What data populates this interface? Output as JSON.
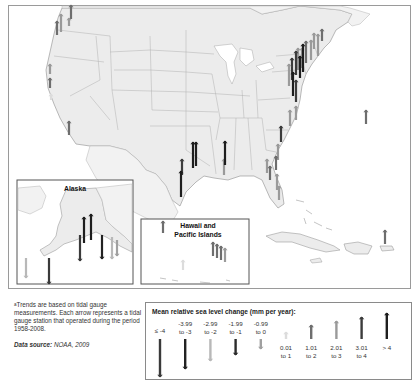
{
  "map": {
    "insets": {
      "alaska": {
        "title": "Alaska"
      },
      "hawaii": {
        "title": "Hawaii and Pacific Islands"
      }
    },
    "colors": {
      "land": "#ececec",
      "state_border": "#a8a8a8",
      "water": "#ffffff",
      "frame": "#9a9a9a"
    },
    "class_colors": {
      "le_-4": "#3a3a3a",
      "-3.99_-3": "#222222",
      "-2.99_-2": "#b8b8b8",
      "-1.99_-1": "#2c2c2c",
      "-0.99_0": "#a0a0a0",
      "0.01_1": "#dcdcdc",
      "1.01_2": "#6e6e6e",
      "2.01_3": "#9a9a9a",
      "3.01_4": "#3c3c3c",
      "gt_4": "#1e1e1e"
    },
    "stations": [
      {
        "region": "pacific_nw",
        "x": 71,
        "y": 19,
        "len": 14,
        "dir": "up",
        "cls": "1.01_2"
      },
      {
        "region": "pacific_nw",
        "x": 69,
        "y": 26,
        "len": 8,
        "dir": "up",
        "cls": "2.01_3"
      },
      {
        "region": "pacific_nw",
        "x": 57,
        "y": 35,
        "len": 14,
        "dir": "up",
        "cls": "1.01_2"
      },
      {
        "region": "pacific_nw",
        "x": 61,
        "y": 32,
        "len": 18,
        "dir": "up",
        "cls": "2.01_3"
      },
      {
        "region": "california",
        "x": 50,
        "y": 74,
        "len": 10,
        "dir": "up",
        "cls": "2.01_3"
      },
      {
        "region": "california",
        "x": 50,
        "y": 88,
        "len": 10,
        "dir": "up",
        "cls": "1.01_2"
      },
      {
        "region": "california",
        "x": 51,
        "y": 100,
        "len": 6,
        "dir": "up",
        "cls": "0.01_1"
      },
      {
        "region": "california",
        "x": 69,
        "y": 135,
        "len": 14,
        "dir": "up",
        "cls": "1.01_2"
      },
      {
        "region": "northeast",
        "x": 322,
        "y": 41,
        "len": 12,
        "dir": "up",
        "cls": "1.01_2"
      },
      {
        "region": "northeast",
        "x": 314,
        "y": 49,
        "len": 16,
        "dir": "up",
        "cls": "2.01_3"
      },
      {
        "region": "northeast",
        "x": 318,
        "y": 56,
        "len": 22,
        "dir": "up",
        "cls": "2.01_3"
      },
      {
        "region": "northeast",
        "x": 311,
        "y": 60,
        "len": 20,
        "dir": "up",
        "cls": "2.01_3"
      },
      {
        "region": "northeast",
        "x": 306,
        "y": 63,
        "len": 22,
        "dir": "up",
        "cls": "1.01_2"
      },
      {
        "region": "northeast",
        "x": 302,
        "y": 68,
        "len": 20,
        "dir": "up",
        "cls": "2.01_3"
      },
      {
        "region": "northeast",
        "x": 298,
        "y": 70,
        "len": 22,
        "dir": "up",
        "cls": "2.01_3"
      },
      {
        "region": "northeast",
        "x": 303,
        "y": 72,
        "len": 28,
        "dir": "up",
        "cls": "gt_4"
      },
      {
        "region": "northeast",
        "x": 296,
        "y": 75,
        "len": 24,
        "dir": "up",
        "cls": "3.01_4"
      },
      {
        "region": "northeast",
        "x": 300,
        "y": 78,
        "len": 22,
        "dir": "up",
        "cls": "gt_4"
      },
      {
        "region": "northeast",
        "x": 292,
        "y": 80,
        "len": 22,
        "dir": "up",
        "cls": "3.01_4"
      },
      {
        "region": "northeast",
        "x": 289,
        "y": 86,
        "len": 22,
        "dir": "up",
        "cls": "2.01_3"
      },
      {
        "region": "northeast",
        "x": 293,
        "y": 96,
        "len": 24,
        "dir": "up",
        "cls": "gt_4"
      },
      {
        "region": "northeast",
        "x": 296,
        "y": 102,
        "len": 22,
        "dir": "up",
        "cls": "3.01_4"
      },
      {
        "region": "mid_atlantic",
        "x": 296,
        "y": 120,
        "len": 14,
        "dir": "up",
        "cls": "2.01_3"
      },
      {
        "region": "mid_atlantic",
        "x": 290,
        "y": 126,
        "len": 16,
        "dir": "up",
        "cls": "2.01_3"
      },
      {
        "region": "bermuda",
        "x": 366,
        "y": 124,
        "len": 14,
        "dir": "up",
        "cls": "1.01_2"
      },
      {
        "region": "southeast",
        "x": 281,
        "y": 142,
        "len": 16,
        "dir": "up",
        "cls": "3.01_4"
      },
      {
        "region": "southeast",
        "x": 278,
        "y": 160,
        "len": 16,
        "dir": "up",
        "cls": "2.01_3"
      },
      {
        "region": "southeast",
        "x": 276,
        "y": 170,
        "len": 14,
        "dir": "up",
        "cls": "1.01_2"
      },
      {
        "region": "southeast",
        "x": 267,
        "y": 173,
        "len": 14,
        "dir": "up",
        "cls": "2.01_3"
      },
      {
        "region": "southeast",
        "x": 270,
        "y": 180,
        "len": 14,
        "dir": "up",
        "cls": "1.01_2"
      },
      {
        "region": "southeast",
        "x": 277,
        "y": 190,
        "len": 16,
        "dir": "up",
        "cls": "2.01_3"
      },
      {
        "region": "southeast",
        "x": 279,
        "y": 200,
        "len": 14,
        "dir": "up",
        "cls": "2.01_3"
      },
      {
        "region": "gulf",
        "x": 224,
        "y": 175,
        "len": 16,
        "dir": "up",
        "cls": "2.01_3"
      },
      {
        "region": "gulf",
        "x": 225,
        "y": 165,
        "len": 24,
        "dir": "up",
        "cls": "gt_4"
      },
      {
        "region": "gulf",
        "x": 196,
        "y": 166,
        "len": 24,
        "dir": "up",
        "cls": "gt_4"
      },
      {
        "region": "gulf",
        "x": 193,
        "y": 168,
        "len": 26,
        "dir": "up",
        "cls": "gt_4"
      },
      {
        "region": "gulf",
        "x": 182,
        "y": 175,
        "len": 16,
        "dir": "up",
        "cls": "3.01_4"
      },
      {
        "region": "gulf",
        "x": 181,
        "y": 197,
        "len": 26,
        "dir": "up",
        "cls": "gt_4"
      },
      {
        "region": "puerto_rico",
        "x": 385,
        "y": 244,
        "len": 14,
        "dir": "up",
        "cls": "1.01_2"
      }
    ],
    "alaska_stations": [
      {
        "x": 84,
        "y": 243,
        "len": 26,
        "dir": "up",
        "cls": "gt_4"
      },
      {
        "x": 91,
        "y": 240,
        "len": 26,
        "dir": "up",
        "cls": "gt_4"
      },
      {
        "x": 80,
        "y": 235,
        "len": 26,
        "dir": "down",
        "cls": "le_-4"
      },
      {
        "x": 102,
        "y": 235,
        "len": 24,
        "dir": "down",
        "cls": "-3.99_-3"
      },
      {
        "x": 112,
        "y": 237,
        "len": 22,
        "dir": "down",
        "cls": "-2.99_-2"
      },
      {
        "x": 117,
        "y": 240,
        "len": 16,
        "dir": "down",
        "cls": "-0.99_0"
      },
      {
        "x": 26,
        "y": 258,
        "len": 20,
        "dir": "down",
        "cls": "-2.99_-2"
      },
      {
        "x": 49,
        "y": 258,
        "len": 26,
        "dir": "down",
        "cls": "le_-4"
      }
    ],
    "hawaii_stations": [
      {
        "x": 163,
        "y": 233,
        "len": 12,
        "dir": "up",
        "cls": "1.01_2"
      },
      {
        "x": 183,
        "y": 270,
        "len": 10,
        "dir": "up",
        "cls": "0.01_1"
      },
      {
        "x": 213,
        "y": 256,
        "len": 14,
        "dir": "up",
        "cls": "1.01_2"
      },
      {
        "x": 217,
        "y": 258,
        "len": 14,
        "dir": "up",
        "cls": "1.01_2"
      },
      {
        "x": 221,
        "y": 260,
        "len": 14,
        "dir": "up",
        "cls": "1.01_2"
      },
      {
        "x": 225,
        "y": 262,
        "len": 14,
        "dir": "up",
        "cls": "2.01_3"
      }
    ]
  },
  "footnote": {
    "marker": "a",
    "text": "Trends are based on tidal gauge measurements. Each arrow represents a tidal gauge station that operated during the period 1958-2008."
  },
  "data_source": {
    "label": "Data source:",
    "value": "NOAA, 2009"
  },
  "legend": {
    "title": "Mean relative sea level change (mm per year):",
    "items": [
      {
        "key": "le_-4",
        "line1": "≤ -4",
        "line2": "",
        "dir": "down",
        "len": 38,
        "color": "#3a3a3a"
      },
      {
        "key": "-3.99_-3",
        "line1": "-3.99",
        "line2": "to -3",
        "dir": "down",
        "len": 30,
        "color": "#222222"
      },
      {
        "key": "-2.99_-2",
        "line1": "-2.99",
        "line2": "to -2",
        "dir": "down",
        "len": 22,
        "color": "#b8b8b8"
      },
      {
        "key": "-1.99_-1",
        "line1": "-1.99",
        "line2": "to -1",
        "dir": "down",
        "len": 16,
        "color": "#2c2c2c"
      },
      {
        "key": "-0.99_0",
        "line1": "-0.99",
        "line2": "to 0",
        "dir": "down",
        "len": 10,
        "color": "#a0a0a0"
      },
      {
        "key": "0.01_1",
        "line1": "0.01",
        "line2": "to 1",
        "dir": "up",
        "len": 7,
        "color": "#dcdcdc"
      },
      {
        "key": "1.01_2",
        "line1": "1.01",
        "line2": "to 2",
        "dir": "up",
        "len": 14,
        "color": "#6e6e6e"
      },
      {
        "key": "2.01_3",
        "line1": "2.01",
        "line2": "to 3",
        "dir": "up",
        "len": 18,
        "color": "#9a9a9a"
      },
      {
        "key": "3.01_4",
        "line1": "3.01",
        "line2": "to 4",
        "dir": "up",
        "len": 22,
        "color": "#3c3c3c"
      },
      {
        "key": "gt_4",
        "line1": "> 4",
        "line2": "",
        "dir": "up",
        "len": 26,
        "color": "#1e1e1e"
      }
    ]
  }
}
